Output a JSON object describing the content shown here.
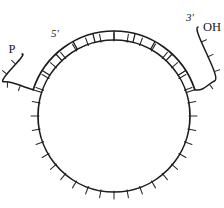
{
  "figure": {
    "kind": "circular-nucleic-acid-hybridization-diagram",
    "background_color": "#ffffff",
    "line_color": "#1c1c1c",
    "width": 224,
    "height": 208
  },
  "labels": {
    "five_prime": "5'",
    "five_prime_terminus": "P",
    "three_prime": "3'",
    "three_prime_terminus": "OH"
  },
  "circle": {
    "center_x": 114,
    "center_y": 116,
    "radius": 76,
    "tick_count": 36,
    "tick_length": 7,
    "description": "closed circular single strand with outward radial tick marks"
  },
  "duplex": {
    "rung_count": 10,
    "start_angle_deg": 198,
    "end_angle_deg": 342,
    "offset": 9,
    "description": "linear strand annealed to the top arc forming a ladder-like duplex"
  },
  "tails": {
    "left": {
      "end_x": 22,
      "end_y": 54,
      "tick_count": 4,
      "label": "P"
    },
    "right": {
      "end_x": 198,
      "end_y": 27,
      "tick_count": 4,
      "label": "OH"
    }
  },
  "label_positions": {
    "five_prime": {
      "x": 55,
      "y": 37
    },
    "p": {
      "x": 12,
      "y": 53
    },
    "three_prime": {
      "x": 190,
      "y": 21
    },
    "oh": {
      "x": 203,
      "y": 31
    }
  }
}
